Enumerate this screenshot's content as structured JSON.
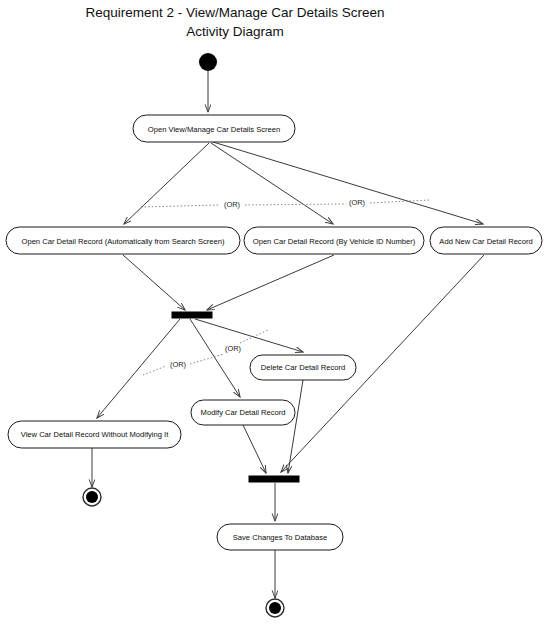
{
  "title": {
    "line1": "Requirement 2 - View/Manage Car Details Screen",
    "line2": "Activity Diagram"
  },
  "colors": {
    "background": "#ffffff",
    "stroke": "#1a1a1a",
    "edge": "#3a3a3a",
    "or_line": "#6f6f6f",
    "node_fill": "#ffffff",
    "bar_fill": "#000000",
    "text": "#0c0c0c"
  },
  "nodes": {
    "start": {
      "name": "initial-node",
      "cx": 208,
      "cy": 62,
      "r": 9
    },
    "open_screen": {
      "label": "Open View/Manage Car Details Screen",
      "x": 133,
      "y": 115,
      "w": 162,
      "h": 27
    },
    "open_auto": {
      "label": "Open Car Detail Record (Automatically from Search Screen)",
      "x": 6,
      "y": 227,
      "w": 234,
      "h": 27
    },
    "open_vin": {
      "label": "Open Car Detail Record (By Vehicle ID Number)",
      "x": 244,
      "y": 227,
      "w": 180,
      "h": 27
    },
    "add_new": {
      "label": "Add New Car Detail Record",
      "x": 430,
      "y": 227,
      "w": 112,
      "h": 27
    },
    "merge_bar": {
      "name": "merge-bar",
      "x": 172,
      "y": 312,
      "w": 40,
      "h": 6
    },
    "delete_rec": {
      "label": "Delete Car Detail Record",
      "x": 250,
      "y": 355,
      "w": 106,
      "h": 25
    },
    "modify_rec": {
      "label": "Modify Car Detail Record",
      "x": 191,
      "y": 400,
      "w": 104,
      "h": 25
    },
    "view_only": {
      "label": "View Car Detail Record Without Modifying It",
      "x": 8,
      "y": 421,
      "w": 173,
      "h": 27
    },
    "join_bar": {
      "name": "join-bar",
      "x": 249,
      "y": 476,
      "w": 50,
      "h": 6
    },
    "save_changes": {
      "label": "Save Changes To Database",
      "x": 217,
      "y": 524,
      "w": 126,
      "h": 26
    },
    "end_left": {
      "name": "final-node-left",
      "cx": 92,
      "cy": 497,
      "r_outer": 9,
      "r_inner": 6
    },
    "end_bottom": {
      "name": "final-node-bottom",
      "cx": 275,
      "cy": 608,
      "r_outer": 9,
      "r_inner": 6
    }
  },
  "or_labels": [
    {
      "text": "(OR)",
      "x": 232,
      "y": 205
    },
    {
      "text": "(OR)",
      "x": 357,
      "y": 203
    },
    {
      "text": "(OR)",
      "x": 178,
      "y": 365
    },
    {
      "text": "(OR)",
      "x": 233,
      "y": 349
    }
  ],
  "edges": [
    {
      "name": "start-to-open-screen",
      "from": "start",
      "to": "open_screen"
    },
    {
      "name": "open-screen-to-open-auto",
      "from": "open_screen",
      "to": "open_auto"
    },
    {
      "name": "open-screen-to-open-vin",
      "from": "open_screen",
      "to": "open_vin"
    },
    {
      "name": "open-screen-to-add-new",
      "from": "open_screen",
      "to": "add_new"
    },
    {
      "name": "open-auto-to-merge",
      "from": "open_auto",
      "to": "merge_bar"
    },
    {
      "name": "open-vin-to-merge",
      "from": "open_vin",
      "to": "merge_bar"
    },
    {
      "name": "merge-to-delete",
      "from": "merge_bar",
      "to": "delete_rec"
    },
    {
      "name": "merge-to-modify",
      "from": "merge_bar",
      "to": "modify_rec"
    },
    {
      "name": "merge-to-view-only",
      "from": "merge_bar",
      "to": "view_only"
    },
    {
      "name": "view-only-to-end-left",
      "from": "view_only",
      "to": "end_left"
    },
    {
      "name": "delete-to-join",
      "from": "delete_rec",
      "to": "join_bar"
    },
    {
      "name": "modify-to-join",
      "from": "modify_rec",
      "to": "join_bar"
    },
    {
      "name": "add-new-to-join",
      "from": "add_new",
      "to": "join_bar"
    },
    {
      "name": "join-to-save",
      "from": "join_bar",
      "to": "save_changes"
    },
    {
      "name": "save-to-end-bottom",
      "from": "save_changes",
      "to": "end_bottom"
    }
  ]
}
